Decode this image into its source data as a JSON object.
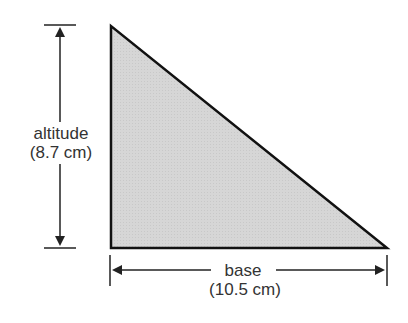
{
  "diagram": {
    "shape": "right-triangle",
    "fill_color": "#d4d4d4",
    "stroke_color": "#111111",
    "altitude": {
      "label": "altitude",
      "value": "(8.7 cm)"
    },
    "base": {
      "label": "base",
      "value": "(10.5 cm)"
    }
  }
}
